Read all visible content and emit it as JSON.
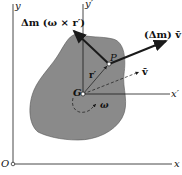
{
  "diagram": {
    "axes": {
      "y_label": "y",
      "x_label": "x",
      "origin_label": "O",
      "y_prime_label": "y′",
      "x_prime_label": "x′"
    },
    "points": {
      "center_label": "G",
      "particle_label": "P"
    },
    "vectors": {
      "r_prime_label": "r′",
      "v_bar_label": "v̄",
      "omega_label": "ω",
      "tangential_momentum_label": "Δm (ω × r′)",
      "translational_momentum_label": "(Δm) v̄"
    },
    "colors": {
      "body_fill": "#8a8a8a",
      "lines": "#1a1a1a"
    }
  }
}
